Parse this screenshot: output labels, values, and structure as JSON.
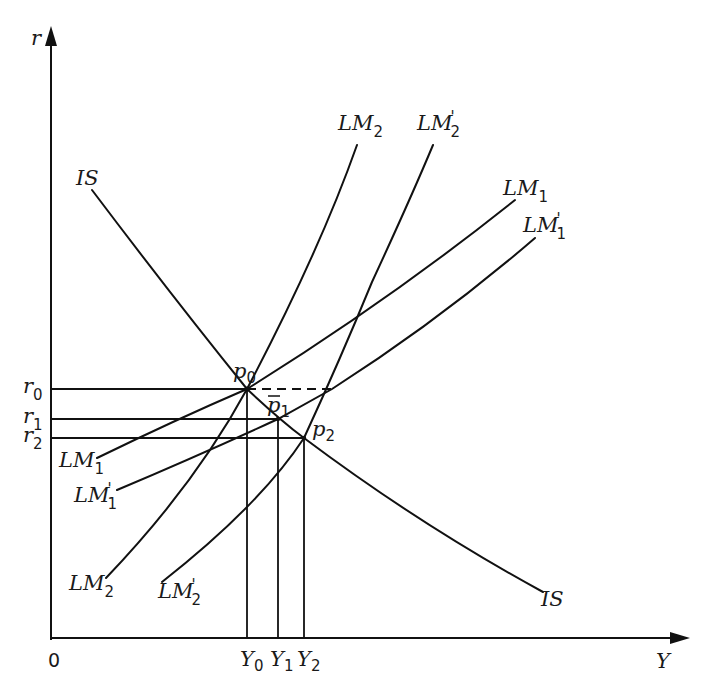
{
  "diagram": {
    "axes": {
      "y_label": "r",
      "x_label": "Y",
      "origin_label": "0"
    },
    "interest_levels": [
      {
        "base": "r",
        "sub": "0"
      },
      {
        "base": "r",
        "sub": "1"
      },
      {
        "base": "r",
        "sub": "2"
      }
    ],
    "output_levels": [
      {
        "base": "Y",
        "sub": "0"
      },
      {
        "base": "Y",
        "sub": "1"
      },
      {
        "base": "Y",
        "sub": "2"
      }
    ],
    "points": [
      {
        "base": "p",
        "sub": "0",
        "bar": false
      },
      {
        "base": "p",
        "sub": "1",
        "bar": true
      },
      {
        "base": "p",
        "sub": "2",
        "bar": false
      }
    ],
    "curves": {
      "IS": {
        "label": "IS"
      },
      "LM1": {
        "base": "LM",
        "sub": "1",
        "prime": ""
      },
      "LM1_prime": {
        "base": "LM",
        "sub": "1",
        "prime": "'"
      },
      "LM2": {
        "base": "LM",
        "sub": "2",
        "prime": ""
      },
      "LM2_prime": {
        "base": "LM",
        "sub": "2",
        "prime": "'"
      }
    },
    "colors": {
      "stroke": "#111111",
      "background": "#ffffff"
    }
  }
}
